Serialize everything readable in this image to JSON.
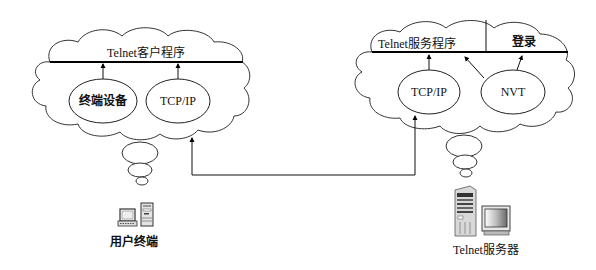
{
  "client": {
    "program_label": "Telnet客户程序",
    "modules": [
      {
        "label": "终端设备"
      },
      {
        "label": "TCP/IP"
      }
    ],
    "device_label": "用户终端"
  },
  "server": {
    "program_label": "Telnet服务程序",
    "login_label": "登录",
    "modules": [
      {
        "label": "TCP/IP"
      },
      {
        "label": "NVT"
      }
    ],
    "device_label": "Telnet服务器"
  },
  "connection": {
    "from": "client.TCP/IP",
    "to": "server.TCP/IP"
  }
}
